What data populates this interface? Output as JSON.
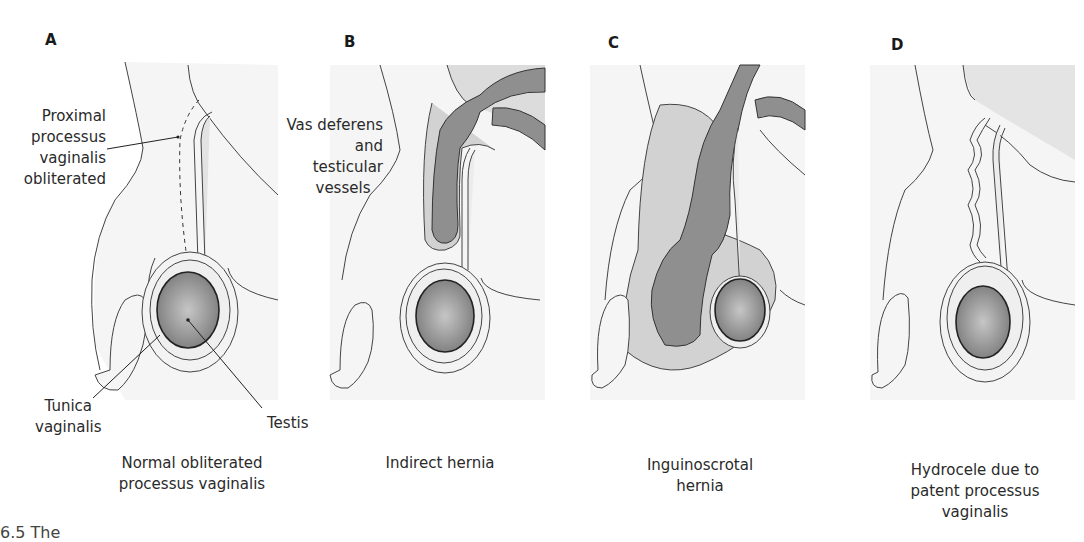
{
  "figure": {
    "panels": [
      {
        "letter": "A",
        "title_lines": [
          "Normal obliterated",
          "processus vaginalis"
        ],
        "callouts": {
          "proximal": [
            "Proximal",
            "processus",
            "vaginalis",
            "obliterated"
          ],
          "tunica": [
            "Tunica",
            "vaginalis"
          ],
          "testis": "Testis"
        }
      },
      {
        "letter": "B",
        "title_lines": [
          "Indirect hernia"
        ],
        "callouts": {
          "vas": [
            "Vas deferens",
            "and testicular",
            "vessels"
          ]
        }
      },
      {
        "letter": "C",
        "title_lines": [
          "Inguinoscrotal",
          "hernia"
        ]
      },
      {
        "letter": "D",
        "title_lines": [
          "Hydrocele due to",
          "patent processus",
          "vaginalis"
        ]
      }
    ],
    "caption_fragment": "6.5 The",
    "colors": {
      "outline": "#333333",
      "skin": "#f3f3f3",
      "abdomen": "#dedede",
      "hernia_sac": "#cfcfcf",
      "bowel": "#8f8f8f",
      "testis_center": "#c4c4c4",
      "testis_edge": "#7a7a7a"
    }
  }
}
